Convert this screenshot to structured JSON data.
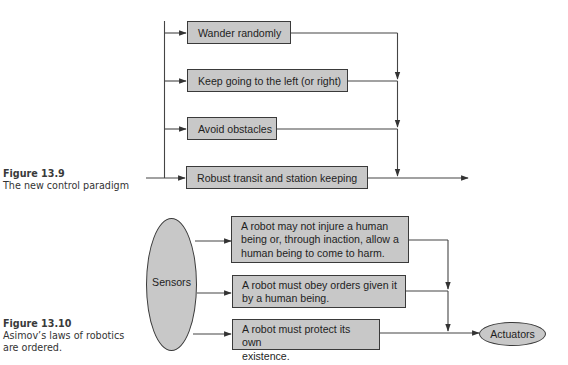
{
  "figure_13_9": {
    "caption": {
      "number": "Figure 13.9",
      "text": "The new control paradigm"
    },
    "behaviors": [
      {
        "label": "Wander randomly"
      },
      {
        "label": "Keep going to the left (or right)"
      },
      {
        "label": "Avoid obstacles"
      },
      {
        "label": "Robust transit and station keeping"
      }
    ]
  },
  "figure_13_10": {
    "caption": {
      "number": "Figure 13.10",
      "line1": "Asimov’s laws of robotics",
      "line2": "are ordered."
    },
    "input_node": {
      "label": "Sensors"
    },
    "laws": [
      {
        "lines": [
          "A robot may not injure a human",
          "being or, through inaction, allow a",
          "human being to come to harm."
        ]
      },
      {
        "lines": [
          "A robot must obey orders given it",
          "by a human being."
        ]
      },
      {
        "lines": [
          "A robot must protect its own",
          "existence."
        ]
      }
    ],
    "output_node": {
      "label": "Actuators"
    }
  },
  "colors": {
    "box_fill": "#c8c8c8",
    "stroke": "#3a3a3a",
    "background": "#ffffff"
  }
}
